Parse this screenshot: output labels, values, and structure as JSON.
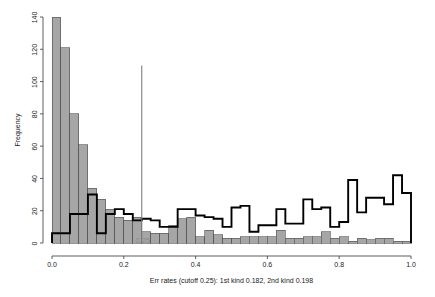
{
  "figure": {
    "title": "",
    "ylabel": "Frequency",
    "xlabel": "Err rates (cutoff 0.25): 1st kind 0.182, 2nd kind 0.198",
    "cutoff_label": "0.25"
  },
  "chart_data": {
    "type": "bar",
    "subtype": "overlaid-histograms",
    "title": "",
    "xlabel": "Err rates (cutoff 0.25): 1st kind 0.182, 2nd kind 0.198",
    "ylabel": "Frequency",
    "xlim": [
      0.0,
      1.0
    ],
    "ylim": [
      0,
      140
    ],
    "xticks": [
      0.0,
      0.2,
      0.4,
      0.6,
      0.8,
      1.0
    ],
    "xtick_labels": [
      "0.0",
      "0.2",
      "0.4",
      "0.6",
      "0.8",
      "1.0"
    ],
    "yticks": [
      0,
      20,
      40,
      60,
      80,
      100,
      120,
      140
    ],
    "ytick_labels": [
      "0",
      "20",
      "40",
      "60",
      "80",
      "100",
      "120",
      "140"
    ],
    "grid": false,
    "legend": null,
    "bin_width": 0.025,
    "bin_edges": [
      0.0,
      0.025,
      0.05,
      0.075,
      0.1,
      0.125,
      0.15,
      0.175,
      0.2,
      0.225,
      0.25,
      0.275,
      0.3,
      0.325,
      0.35,
      0.375,
      0.4,
      0.425,
      0.45,
      0.475,
      0.5,
      0.525,
      0.55,
      0.575,
      0.6,
      0.625,
      0.65,
      0.675,
      0.7,
      0.725,
      0.75,
      0.775,
      0.8,
      0.825,
      0.85,
      0.875,
      0.9,
      0.925,
      0.95,
      0.975,
      1.0
    ],
    "series": [
      {
        "name": "negative-class",
        "style": "filled-gray",
        "fill": "#a6a6a6",
        "stroke": "#4d4d4d",
        "values": [
          140,
          121,
          80,
          61,
          34,
          27,
          21,
          16,
          14,
          16,
          7,
          6,
          6,
          11,
          15,
          16,
          4,
          8,
          5,
          3,
          3,
          4,
          4,
          4,
          4,
          8,
          3,
          3,
          4,
          4,
          7,
          3,
          4,
          1,
          3,
          2,
          3,
          3,
          1,
          1
        ]
      },
      {
        "name": "positive-class",
        "style": "step-outline",
        "fill": "none",
        "stroke": "#000000",
        "values": [
          6,
          6,
          18,
          18,
          30,
          6,
          18,
          21,
          18,
          14,
          15,
          14,
          10,
          10,
          21,
          21,
          17,
          16,
          15,
          10,
          22,
          23,
          7,
          11,
          11,
          21,
          12,
          12,
          27,
          21,
          22,
          10,
          13,
          39,
          19,
          28,
          28,
          24,
          42,
          31
        ]
      }
    ],
    "cutoff": {
      "value": 0.25,
      "label": "0.25",
      "line_top_frequency": 110,
      "color": "#808080"
    },
    "annotations": [
      {
        "text": "0.25",
        "x": 0.25,
        "y": 3,
        "color": "#8a8a8a"
      }
    ],
    "error_rates": {
      "cutoff": 0.25,
      "first_kind": 0.182,
      "second_kind": 0.198
    }
  }
}
